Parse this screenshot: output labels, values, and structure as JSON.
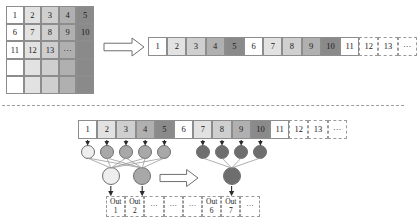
{
  "figure": {
    "divider": "dashed-horizontal-separator"
  },
  "colors": {
    "shade_0": "#ffffff",
    "shade_1": "#e2e2e2",
    "shade_2": "#cfcfcf",
    "shade_3": "#b0b0b0",
    "shade_4": "#8a8a8a",
    "border": "#8d8d8d",
    "dashed_border": "#9a9a9a",
    "node_light": "#eeeeee",
    "node_mid": "#a8a8a8",
    "node_dark": "#6e6e6e",
    "arrow_outline": "#6f6f6f",
    "arrow_fill": "#ffffff",
    "connector": "#9b9b9b",
    "text": "#1a1a1a"
  },
  "matrix": {
    "name": "input-matrix",
    "rows": 5,
    "cols": 5,
    "column_shades": [
      "shade_0",
      "shade_1",
      "shade_2",
      "shade_3",
      "shade_4"
    ],
    "cells": [
      [
        "1",
        "2",
        "3",
        "4",
        "5"
      ],
      [
        "6",
        "7",
        "8",
        "9",
        "10"
      ],
      [
        "11",
        "12",
        "13",
        "···",
        ""
      ],
      [
        "",
        "",
        "",
        "",
        ""
      ],
      [
        "",
        "",
        "",
        "",
        ""
      ]
    ]
  },
  "arrow_top": {
    "name": "transform-arrow-top",
    "direction": "right"
  },
  "arrow_bottom": {
    "name": "transform-arrow-bottom",
    "direction": "right"
  },
  "top_strip": {
    "name": "flattened-sequence-strip",
    "cells": [
      {
        "label": "1",
        "shade": "shade_0",
        "dashed": false
      },
      {
        "label": "2",
        "shade": "shade_1",
        "dashed": false
      },
      {
        "label": "3",
        "shade": "shade_2",
        "dashed": false
      },
      {
        "label": "4",
        "shade": "shade_3",
        "dashed": false
      },
      {
        "label": "5",
        "shade": "shade_4",
        "dashed": false
      },
      {
        "label": "6",
        "shade": "shade_0",
        "dashed": false
      },
      {
        "label": "7",
        "shade": "shade_1",
        "dashed": false
      },
      {
        "label": "8",
        "shade": "shade_2",
        "dashed": false
      },
      {
        "label": "9",
        "shade": "shade_3",
        "dashed": false
      },
      {
        "label": "10",
        "shade": "shade_4",
        "dashed": false
      },
      {
        "label": "11",
        "shade": "shade_0",
        "dashed": false
      },
      {
        "label": "12",
        "shade": "shade_0",
        "dashed": true
      },
      {
        "label": "13",
        "shade": "shade_0",
        "dashed": true
      },
      {
        "label": "···",
        "shade": "shade_0",
        "dashed": true
      }
    ]
  },
  "bottom_strip": {
    "name": "pooling-input-strip",
    "cells": [
      {
        "label": "1",
        "shade": "shade_0",
        "dashed": false
      },
      {
        "label": "2",
        "shade": "shade_1",
        "dashed": false
      },
      {
        "label": "3",
        "shade": "shade_2",
        "dashed": false
      },
      {
        "label": "4",
        "shade": "shade_3",
        "dashed": false
      },
      {
        "label": "5",
        "shade": "shade_4",
        "dashed": false
      },
      {
        "label": "6",
        "shade": "shade_0",
        "dashed": false
      },
      {
        "label": "7",
        "shade": "shade_1",
        "dashed": false
      },
      {
        "label": "8",
        "shade": "shade_2",
        "dashed": false
      },
      {
        "label": "9",
        "shade": "shade_3",
        "dashed": false
      },
      {
        "label": "10",
        "shade": "shade_4",
        "dashed": false
      },
      {
        "label": "11",
        "shade": "shade_0",
        "dashed": false
      },
      {
        "label": "12",
        "shade": "shade_0",
        "dashed": true
      },
      {
        "label": "13",
        "shade": "shade_0",
        "dashed": true
      },
      {
        "label": "···",
        "shade": "shade_0",
        "dashed": true
      }
    ]
  },
  "node_groups": {
    "left": {
      "name": "left-node-group",
      "level1": [
        {
          "shade": "node_light"
        },
        {
          "shade": "node_mid"
        },
        {
          "shade": "node_mid"
        },
        {
          "shade": "node_mid"
        },
        {
          "shade": "node_mid"
        }
      ],
      "level2": [
        {
          "shade": "node_light"
        },
        {
          "shade": "node_mid"
        }
      ]
    },
    "right": {
      "name": "right-node-group",
      "level1": [
        {
          "shade": "node_dark"
        },
        {
          "shade": "node_dark"
        },
        {
          "shade": "node_dark"
        },
        {
          "shade": "node_dark"
        }
      ],
      "level2": [
        {
          "shade": "node_dark"
        }
      ]
    }
  },
  "out_strip": {
    "name": "output-strip",
    "cells": [
      {
        "line1": "Out",
        "line2": "1",
        "dashed": true
      },
      {
        "line1": "Out",
        "line2": "2",
        "dashed": true
      },
      {
        "line1": "···",
        "line2": "",
        "dashed": true
      },
      {
        "line1": "···",
        "line2": "",
        "dashed": true
      },
      {
        "line1": "···",
        "line2": "",
        "dashed": true
      },
      {
        "line1": "Out",
        "line2": "6",
        "dashed": true
      },
      {
        "line1": "Out",
        "line2": "7",
        "dashed": true
      },
      {
        "line1": "···",
        "line2": "",
        "dashed": true
      }
    ]
  }
}
